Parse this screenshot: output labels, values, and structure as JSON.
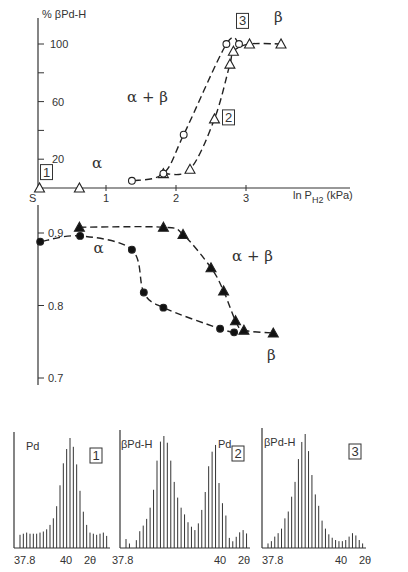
{
  "chart_data": [
    {
      "id": "upper",
      "type": "line",
      "title": "",
      "ylabel": "% βPd-H",
      "xlabel": "ln P_H2 (kPa)",
      "xlabel_main": "ln P",
      "xlabel_sub": "H2",
      "xlabel_unit": "(kPa)",
      "xlim": [
        0,
        4.2
      ],
      "ylim": [
        0,
        110
      ],
      "x_origin_label": "S",
      "xticks": [
        1,
        2,
        3
      ],
      "xtick_labels": [
        "1",
        "2",
        "3"
      ],
      "yticks": [
        20,
        40,
        60,
        80,
        100
      ],
      "ytick_labels": [
        "20",
        "",
        "60",
        "",
        "100"
      ],
      "region_labels": [
        {
          "text": "α",
          "x": 0.8,
          "y": 14
        },
        {
          "text": "α + β",
          "x": 1.3,
          "y": 60
        },
        {
          "text": "β",
          "x": 3.4,
          "y": 115
        }
      ],
      "box_labels": [
        {
          "text": "1",
          "x": 0.15,
          "y": 10
        },
        {
          "text": "2",
          "x": 2.75,
          "y": 48
        },
        {
          "text": "3",
          "x": 2.95,
          "y": 115
        }
      ],
      "series": [
        {
          "name": "absorption",
          "marker": "triangle-open",
          "points": [
            [
              0.05,
              0
            ],
            [
              0.62,
              0
            ],
            [
              1.82,
              10
            ],
            [
              2.2,
              13
            ],
            [
              2.55,
              48
            ],
            [
              2.77,
              86
            ],
            [
              2.82,
              95
            ],
            [
              3.05,
              100
            ],
            [
              3.5,
              100
            ]
          ]
        },
        {
          "name": "desorption",
          "marker": "circle-open",
          "points": [
            [
              2.9,
              100
            ],
            [
              2.72,
              100
            ],
            [
              2.11,
              37
            ],
            [
              1.82,
              10
            ],
            [
              1.37,
              5
            ]
          ]
        }
      ]
    },
    {
      "id": "lower",
      "type": "line",
      "ylabel": "",
      "xlim": [
        0,
        4.2
      ],
      "ylim": [
        0.69,
        0.93
      ],
      "yticks": [
        0.9,
        0.8,
        0.7
      ],
      "ytick_labels": [
        "0.9",
        "0.8",
        "0.7"
      ],
      "region_labels": [
        {
          "text": "α",
          "x": 0.82,
          "y": 0.873
        },
        {
          "text": "α + β",
          "x": 2.8,
          "y": 0.862
        },
        {
          "text": "β",
          "x": 3.3,
          "y": 0.725
        }
      ],
      "series": [
        {
          "name": "absorption",
          "marker": "triangle-filled",
          "points": [
            [
              0.62,
              0.908
            ],
            [
              1.82,
              0.908
            ],
            [
              2.1,
              0.898
            ],
            [
              2.5,
              0.852
            ],
            [
              2.68,
              0.82
            ],
            [
              2.85,
              0.779
            ],
            [
              2.97,
              0.766
            ],
            [
              3.39,
              0.762
            ]
          ]
        },
        {
          "name": "desorption",
          "marker": "circle-filled",
          "points": [
            [
              2.83,
              0.763
            ],
            [
              2.63,
              0.768
            ],
            [
              1.82,
              0.797
            ],
            [
              1.54,
              0.818
            ],
            [
              1.37,
              0.877
            ],
            [
              0.63,
              0.896
            ],
            [
              0.06,
              0.888
            ]
          ]
        }
      ]
    },
    {
      "id": "xrd-1",
      "type": "bar",
      "panel_label": "1",
      "phase_labels": [
        "Pd"
      ],
      "xtick_labels": [
        "37.8",
        "40"
      ],
      "xunit": "2θ",
      "values": [
        12,
        13,
        14,
        13,
        13,
        13,
        14,
        15,
        17,
        21,
        27,
        38,
        57,
        77,
        90,
        100,
        92,
        76,
        52,
        33,
        21,
        14,
        13,
        12,
        13,
        14,
        11
      ]
    },
    {
      "id": "xrd-2",
      "type": "bar",
      "panel_label": "2",
      "phase_labels": [
        "βPd-H",
        "Pd"
      ],
      "xtick_labels": [
        "37.8",
        "40"
      ],
      "xunit": "2θ",
      "values": [
        8,
        4,
        0,
        7,
        15,
        20,
        26,
        36,
        52,
        78,
        95,
        100,
        94,
        78,
        59,
        45,
        36,
        30,
        23,
        19,
        16,
        22,
        34,
        50,
        73,
        86,
        92,
        58,
        40,
        29,
        9,
        6,
        10,
        14,
        16,
        13
      ]
    },
    {
      "id": "xrd-3",
      "type": "bar",
      "panel_label": "3",
      "phase_labels": [
        "βPd-H"
      ],
      "xtick_labels": [
        "37.8",
        "40"
      ],
      "xunit": "2θ",
      "values": [
        4,
        6,
        10,
        13,
        17,
        26,
        32,
        45,
        58,
        78,
        93,
        100,
        85,
        64,
        47,
        37,
        24,
        17,
        12,
        9,
        7,
        6,
        6,
        7,
        10,
        13,
        11,
        7,
        4
      ]
    }
  ]
}
